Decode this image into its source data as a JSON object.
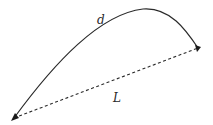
{
  "diagram": {
    "curve": {
      "label": "d",
      "style": "solid",
      "color": "#2a2a2a"
    },
    "chord": {
      "label": "L",
      "style": "dashed",
      "color": "#2a2a2a"
    },
    "endpoints": {
      "start": {
        "x": 14,
        "y": 118
      },
      "end": {
        "x": 198,
        "y": 48
      },
      "peak": {
        "x": 145,
        "y": 9
      }
    }
  }
}
